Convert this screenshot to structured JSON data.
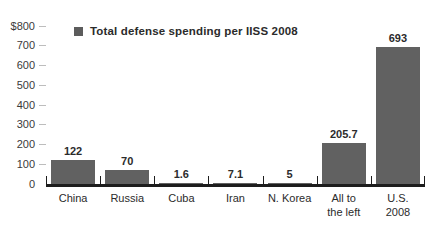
{
  "chart_data": {
    "type": "bar",
    "title": "",
    "subtitle": "",
    "xlabel": "",
    "ylabel": "",
    "ylim": [
      0,
      800
    ],
    "yticks": [
      "$800",
      "700",
      "600",
      "500",
      "400",
      "300",
      "200",
      "100",
      "0"
    ],
    "ytick_values": [
      800,
      700,
      600,
      500,
      400,
      300,
      200,
      100,
      0
    ],
    "grid": false,
    "legend_position": "top-left",
    "legend": [
      {
        "label": "Total defense spending per IISS 2008",
        "color": "#5c5c5c"
      }
    ],
    "categories": [
      "China",
      "Russia",
      "Cuba",
      "Iran",
      "N. Korea",
      "All to the left",
      "U.S. 2008"
    ],
    "category_lines": [
      [
        "China"
      ],
      [
        "Russia"
      ],
      [
        "Cuba"
      ],
      [
        "Iran"
      ],
      [
        "N. Korea"
      ],
      [
        "All to",
        "the left"
      ],
      [
        "U.S.",
        "2008"
      ]
    ],
    "values": [
      122,
      70,
      1.6,
      7.1,
      5,
      205.7,
      693
    ],
    "value_labels": [
      "122",
      "70",
      "1.6",
      "7.1",
      "5",
      "205.7",
      "693"
    ],
    "series": [
      {
        "name": "Total defense spending per IISS 2008",
        "color": "#616161",
        "values": [
          122,
          70,
          1.6,
          7.1,
          5,
          205.7,
          693
        ]
      }
    ]
  },
  "colors": {
    "bar": "#616161",
    "legend_swatch": "#5c5c5c",
    "axis_line": "#1d1d1d",
    "tick_dash": "#bdbdbd",
    "text": "#2b2b2b",
    "background": "#ffffff"
  }
}
